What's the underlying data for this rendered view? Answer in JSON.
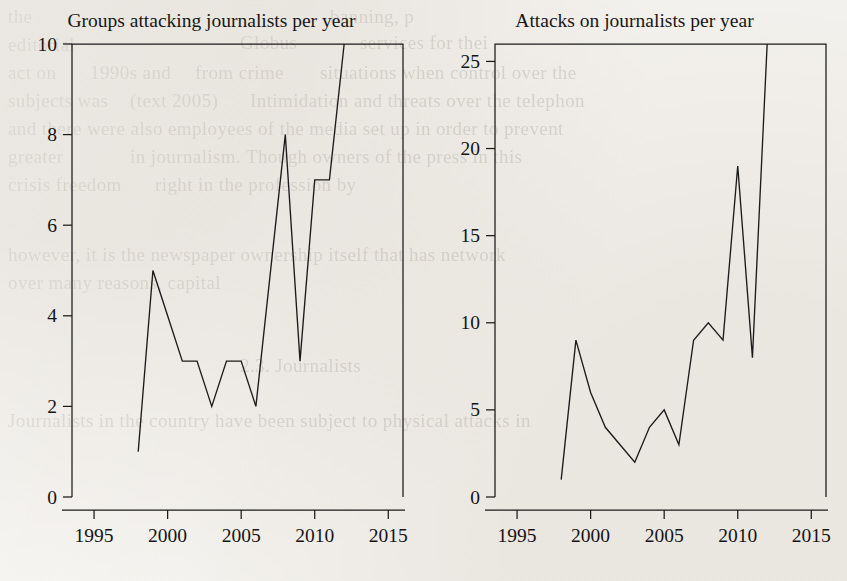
{
  "page": {
    "background_color": "#f4f2ee",
    "ink_color": "#1b1b1b",
    "bleed_through_color": "#6b6257"
  },
  "bleed_through_text": [
    {
      "text": "the",
      "x": 8,
      "y": 6
    },
    {
      "text": "banning, p",
      "x": 330,
      "y": 6
    },
    {
      "text": "editorial",
      "x": 8,
      "y": 34
    },
    {
      "text": "Globus",
      "x": 240,
      "y": 32
    },
    {
      "text": "services for thei",
      "x": 360,
      "y": 32
    },
    {
      "text": "act on",
      "x": 8,
      "y": 62
    },
    {
      "text": "1990s and",
      "x": 90,
      "y": 62
    },
    {
      "text": "from crime",
      "x": 195,
      "y": 62
    },
    {
      "text": "situations when control over the",
      "x": 320,
      "y": 62
    },
    {
      "text": "subjects was",
      "x": 8,
      "y": 90
    },
    {
      "text": "(text 2005)",
      "x": 130,
      "y": 90
    },
    {
      "text": "Intimidation and threats over the telephon",
      "x": 250,
      "y": 90
    },
    {
      "text": "and there were also employees of the media set up in order to prevent",
      "x": 8,
      "y": 118
    },
    {
      "text": "greater",
      "x": 8,
      "y": 146
    },
    {
      "text": "in journalism. Though owners of the press in this",
      "x": 130,
      "y": 146
    },
    {
      "text": "crisis freedom",
      "x": 8,
      "y": 174
    },
    {
      "text": "right in the profession by",
      "x": 155,
      "y": 174
    },
    {
      "text": "however, it is the newspaper ownership itself that has network",
      "x": 8,
      "y": 244
    },
    {
      "text": "over many reasons, capital",
      "x": 8,
      "y": 272
    },
    {
      "text": "2.3. Journalists",
      "x": 240,
      "y": 355
    },
    {
      "text": "Journalists in the country have been subject to physical attacks in",
      "x": 8,
      "y": 410
    }
  ],
  "charts": [
    {
      "id": "groups-attacking-journalists",
      "chart_data": {
        "type": "line",
        "title": "Groups attacking journalists per year",
        "xlabel": "",
        "ylabel": "",
        "xlim": [
          1993.5,
          2016
        ],
        "ylim": [
          0,
          10
        ],
        "xticks": [
          1995,
          2000,
          2005,
          2010,
          2015
        ],
        "yticks": [
          0,
          2,
          4,
          6,
          8,
          10
        ],
        "grid": false,
        "legend": "none",
        "x": [
          1998,
          1999,
          2000,
          2001,
          2002,
          2003,
          2004,
          2005,
          2006,
          2007,
          2008,
          2009,
          2010,
          2011,
          2012
        ],
        "values": [
          1,
          5,
          4,
          3,
          3,
          2,
          3,
          3,
          2,
          5,
          8,
          3,
          7,
          7,
          10
        ],
        "series": [
          {
            "name": "Groups attacking journalists",
            "values": [
              1,
              5,
              4,
              3,
              3,
              2,
              3,
              3,
              2,
              5,
              8,
              3,
              7,
              7,
              10
            ]
          }
        ]
      }
    },
    {
      "id": "attacks-on-journalists",
      "chart_data": {
        "type": "line",
        "title": "Attacks on journalists per year",
        "xlabel": "",
        "ylabel": "",
        "xlim": [
          1993.5,
          2016
        ],
        "ylim": [
          0,
          26
        ],
        "xticks": [
          1995,
          2000,
          2005,
          2010,
          2015
        ],
        "yticks": [
          0,
          5,
          10,
          15,
          20,
          25
        ],
        "grid": false,
        "legend": "none",
        "x": [
          1998,
          1999,
          2000,
          2001,
          2002,
          2003,
          2004,
          2005,
          2006,
          2007,
          2008,
          2009,
          2010,
          2011,
          2012
        ],
        "values": [
          1,
          9,
          6,
          4,
          3,
          2,
          4,
          5,
          3,
          9,
          10,
          9,
          19,
          8,
          26
        ],
        "series": [
          {
            "name": "Attacks on journalists",
            "values": [
              1,
              9,
              6,
              4,
              3,
              2,
              4,
              5,
              3,
              9,
              10,
              9,
              19,
              8,
              26
            ]
          }
        ]
      }
    }
  ]
}
